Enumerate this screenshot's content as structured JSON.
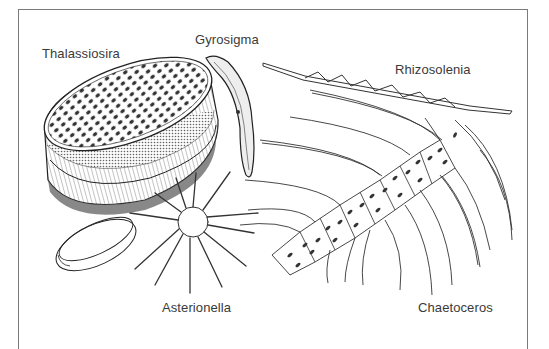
{
  "figure": {
    "type": "scientific-illustration",
    "labels": {
      "thalassiosira": "Thalassiosira",
      "gyrosigma": "Gyrosigma",
      "rhizosolenia": "Rhizosolenia",
      "asterionella": "Asterionella",
      "chaetoceros": "Chaetoceros"
    },
    "colors": {
      "ink": "#2a2a2a",
      "frame": "#7a7a7a",
      "background": "#ffffff"
    }
  }
}
